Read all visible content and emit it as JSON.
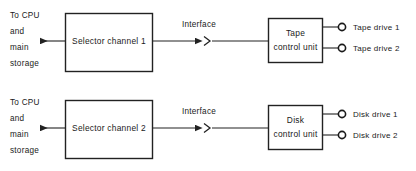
{
  "diagram": {
    "colors": {
      "background": "#ffffff",
      "line": "#222222",
      "text": "#1a1a1a"
    },
    "rows": [
      {
        "id": "tape-row",
        "host_label": {
          "line1": "To CPU",
          "line2": "and",
          "line3": "main",
          "line4": "storage"
        },
        "channel_box": "Selector channel 1",
        "interface_label": "Interface",
        "control_unit": {
          "line1": "Tape",
          "line2": "control unit"
        },
        "devices": [
          "Tape drive 1",
          "Tape drive 2"
        ]
      },
      {
        "id": "disk-row",
        "host_label": {
          "line1": "To CPU",
          "line2": "and",
          "line3": "main",
          "line4": "storage"
        },
        "channel_box": "Selector channel 2",
        "interface_label": "Interface",
        "control_unit": {
          "line1": "Disk",
          "line2": "control unit"
        },
        "devices": [
          "Disk drive 1",
          "Disk drive 2"
        ]
      }
    ]
  }
}
